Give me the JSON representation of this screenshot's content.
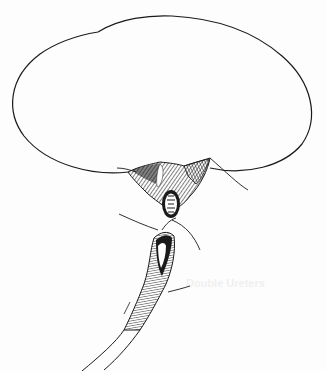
{
  "figure": {
    "type": "medical-illustration",
    "colors": {
      "ink": "#1a1a1a",
      "paper": "#fdfdfd"
    }
  },
  "bleed_through": {
    "heading": "Double Ureters"
  }
}
